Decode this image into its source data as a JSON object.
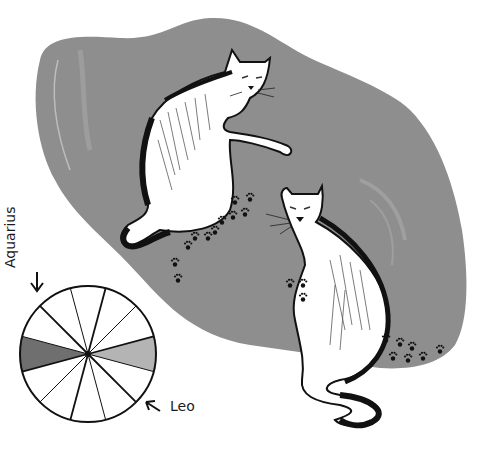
{
  "illustration": {
    "subject": "Two white cats on a grey rug with paw prints, beside a zodiac wheel",
    "colors": {
      "background": "#ffffff",
      "rug": "#8e8e8e",
      "rug_highlight": "#a8a8a8",
      "ink": "#111111",
      "cat_fill": "#ffffff",
      "aquarius_segment": "#6f6f6f",
      "leo_segment": "#b4b4b4"
    }
  },
  "zodiac_wheel": {
    "segments": 12,
    "highlighted": [
      {
        "sign": "Aquarius",
        "shade": "dark"
      },
      {
        "sign": "Leo",
        "shade": "light"
      }
    ]
  },
  "labels": {
    "aquarius": "Aquarius",
    "leo": "Leo"
  },
  "icons": {
    "aquarius_arrow": "arrow-down-icon",
    "leo_arrow": "arrow-up-left-icon",
    "paw_print": "paw-print-icon"
  }
}
